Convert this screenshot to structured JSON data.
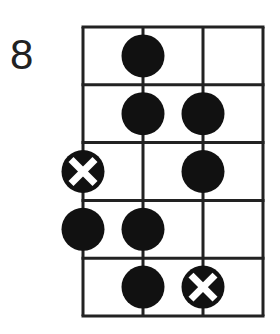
{
  "diagram": {
    "type": "fretboard-scale-diagram",
    "start_fret_label": "8",
    "strings": 4,
    "frets": 5,
    "colors": {
      "line": "#222222",
      "dot": "#111111",
      "x_mark": "#ffffff",
      "background": "#ffffff"
    },
    "markers": [
      {
        "string": 2,
        "fret": 1,
        "kind": "dot"
      },
      {
        "string": 2,
        "fret": 2,
        "kind": "dot"
      },
      {
        "string": 3,
        "fret": 2,
        "kind": "dot"
      },
      {
        "string": 1,
        "fret": 3,
        "kind": "root-x"
      },
      {
        "string": 3,
        "fret": 3,
        "kind": "dot"
      },
      {
        "string": 1,
        "fret": 4,
        "kind": "dot"
      },
      {
        "string": 2,
        "fret": 4,
        "kind": "dot"
      },
      {
        "string": 2,
        "fret": 5,
        "kind": "dot"
      },
      {
        "string": 3,
        "fret": 5,
        "kind": "root-x"
      }
    ]
  }
}
